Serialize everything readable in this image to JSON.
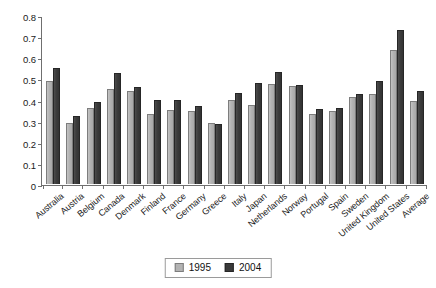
{
  "chart_data": {
    "type": "bar",
    "title": "",
    "xlabel": "",
    "ylabel": "",
    "ylim": [
      0,
      0.8
    ],
    "ytick_labels": [
      "0.8",
      "0.7",
      "0.6",
      "0.5",
      "0.4",
      "0.3",
      "0.2",
      "0.1",
      "0"
    ],
    "yticks": [
      0.8,
      0.7,
      0.6,
      0.5,
      0.4,
      0.3,
      0.2,
      0.1,
      0
    ],
    "grid": false,
    "legend_position": "bottom-center",
    "categories": [
      "Australia",
      "Austria",
      "Belgium",
      "Canada",
      "Denmark",
      "Finland",
      "France",
      "Germany",
      "Greece",
      "Italy",
      "Japan",
      "Netherlands",
      "Norway",
      "Portugal",
      "Spain",
      "Sweden",
      "United Kingdom",
      "United States",
      "Average"
    ],
    "series": [
      {
        "name": "1995",
        "color": "#b3b3b3",
        "values": [
          0.49,
          0.29,
          0.36,
          0.45,
          0.44,
          0.33,
          0.35,
          0.345,
          0.29,
          0.4,
          0.375,
          0.475,
          0.465,
          0.33,
          0.345,
          0.41,
          0.425,
          0.635,
          0.395
        ]
      },
      {
        "name": "2004",
        "color": "#3a3a3a",
        "values": [
          0.55,
          0.32,
          0.39,
          0.525,
          0.46,
          0.4,
          0.4,
          0.37,
          0.285,
          0.43,
          0.48,
          0.53,
          0.47,
          0.355,
          0.36,
          0.425,
          0.49,
          0.73,
          0.44
        ]
      }
    ]
  },
  "legend": {
    "items": [
      {
        "label": "1995",
        "key": "y1995"
      },
      {
        "label": "2004",
        "key": "y2004"
      }
    ]
  }
}
